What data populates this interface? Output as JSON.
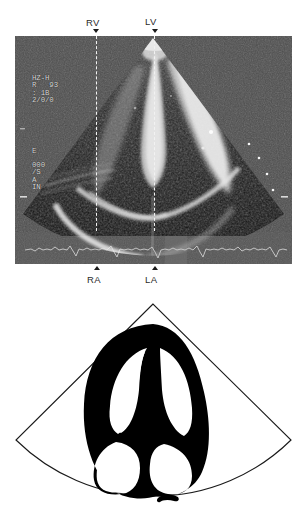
{
  "figure": {
    "type": "apical-four-chamber-echocardiogram"
  },
  "echo": {
    "overlay": {
      "line1": "HZ-H\nR   93\n: 1B\n2/0/0",
      "line2": "E",
      "line3": "000\n/S\nA\nIN"
    },
    "markers": {
      "top_left": "RV",
      "top_right": "LV",
      "bottom_left": "RA",
      "bottom_right": "LA"
    }
  },
  "diagram": {
    "labels": {
      "ivs": "IVS",
      "rv": "RV",
      "lv": "LV",
      "ra": "RA",
      "la": "LA"
    }
  },
  "colors": {
    "myocardium": "#000000",
    "chamber": "#ffffff",
    "sector_outline": "#1a1a1a",
    "caliper": "#f2f2f2",
    "overlay_text": "#dcdcdc"
  }
}
